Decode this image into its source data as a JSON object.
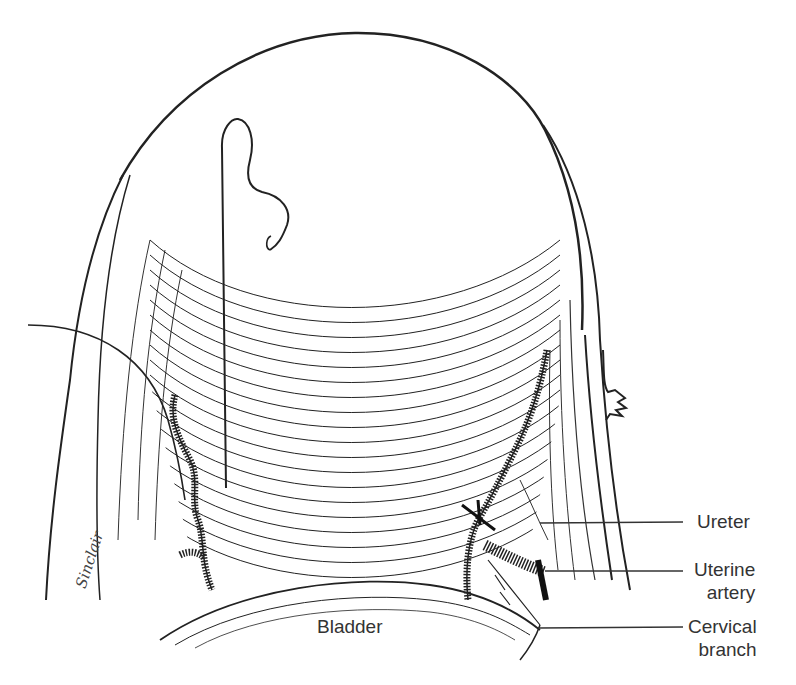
{
  "figure": {
    "type": "anatomical-illustration",
    "ink_color": "#222222",
    "background": "#ffffff"
  },
  "labels": {
    "ureter": "Ureter",
    "uterine_artery": "Uterine\nartery",
    "cervical_branch": "Cervical\nbranch",
    "bladder": "Bladder"
  },
  "signature": "Sinclair"
}
